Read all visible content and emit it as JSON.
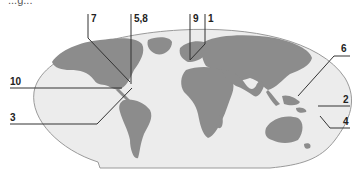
{
  "diagram": {
    "type": "world-map-labeled",
    "colors": {
      "ocean": "#ececec",
      "land": "#8c8c8c",
      "outline": "#9a9a9a",
      "leader_line": "#333333",
      "label_text": "#222222"
    },
    "cropped_text": "...g...",
    "labels": [
      {
        "id": "label-7",
        "text": "7"
      },
      {
        "id": "label-5-8",
        "text": "5,8"
      },
      {
        "id": "label-9",
        "text": "9"
      },
      {
        "id": "label-1",
        "text": "1"
      },
      {
        "id": "label-6",
        "text": "6"
      },
      {
        "id": "label-10",
        "text": "10"
      },
      {
        "id": "label-3",
        "text": "3"
      },
      {
        "id": "label-2",
        "text": "2"
      },
      {
        "id": "label-4",
        "text": "4"
      }
    ]
  }
}
